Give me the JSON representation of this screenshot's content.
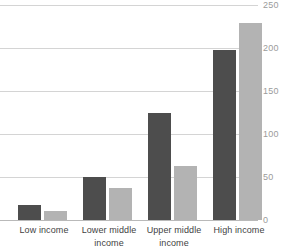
{
  "chart_data": {
    "type": "bar",
    "title": "",
    "subtitle": "",
    "xlabel": "",
    "ylabel": "",
    "ylim": [
      0,
      250
    ],
    "yticks": [
      0,
      50,
      100,
      150,
      200,
      250
    ],
    "ytick_labels": [
      "0",
      "50",
      "100",
      "150",
      "200",
      "250"
    ],
    "grid": true,
    "legend": "none",
    "orientation": "vertical",
    "categories": [
      "Low income",
      "Lower middle income",
      "Upper middle income",
      "High income"
    ],
    "category_lines": [
      [
        "Low income"
      ],
      [
        "Lower middle",
        "income"
      ],
      [
        "Upper middle",
        "income"
      ],
      [
        "High income"
      ]
    ],
    "series": [
      {
        "name": "series-1",
        "color": "#4d4d4d",
        "values": [
          17,
          50,
          125,
          198
        ]
      },
      {
        "name": "series-2",
        "color": "#b3b3b3",
        "values": [
          10,
          37,
          63,
          229
        ]
      }
    ]
  },
  "colors": {
    "series_dark": "#4d4d4d",
    "series_light": "#b3b3b3",
    "gridline": "#d4d4d4",
    "baseline": "#b9b9b9",
    "tick_text": "#9b9b9b",
    "category_text": "#3f3f3f",
    "background": "#ffffff"
  }
}
